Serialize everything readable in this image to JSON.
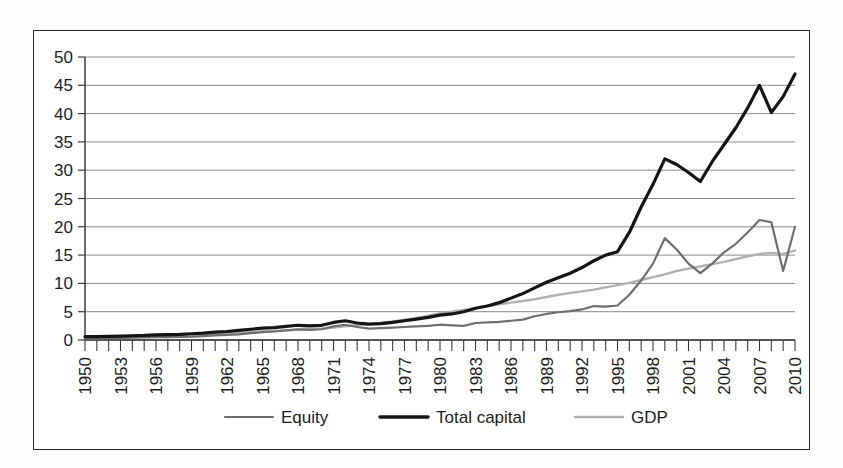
{
  "chart_data": {
    "type": "line",
    "title": "",
    "xlabel": "",
    "ylabel": "",
    "xlim": [
      1950,
      2010
    ],
    "ylim": [
      0,
      50
    ],
    "ytick_step": 5,
    "ytick_labels": [
      "0",
      "5",
      "10",
      "15",
      "20",
      "25",
      "30",
      "35",
      "40",
      "45",
      "50"
    ],
    "xtick_labels": [
      "1950",
      "1953",
      "1956",
      "1959",
      "1962",
      "1965",
      "1968",
      "1971",
      "1974",
      "1977",
      "1980",
      "1983",
      "1986",
      "1989",
      "1992",
      "1995",
      "1998",
      "2001",
      "2004",
      "2007",
      "2010"
    ],
    "xtick_label_rotation": -90,
    "xtick_label_every": 3,
    "grid": "horizontal",
    "legend_position": "bottom",
    "x": [
      1950,
      1951,
      1952,
      1953,
      1954,
      1955,
      1956,
      1957,
      1958,
      1959,
      1960,
      1961,
      1962,
      1963,
      1964,
      1965,
      1966,
      1967,
      1968,
      1969,
      1970,
      1971,
      1972,
      1973,
      1974,
      1975,
      1976,
      1977,
      1978,
      1979,
      1980,
      1981,
      1982,
      1983,
      1984,
      1985,
      1986,
      1987,
      1988,
      1989,
      1990,
      1991,
      1992,
      1993,
      1994,
      1995,
      1996,
      1997,
      1998,
      1999,
      2000,
      2001,
      2002,
      2003,
      2004,
      2005,
      2006,
      2007,
      2008,
      2009,
      2010
    ],
    "series": [
      {
        "name": "Equity",
        "color": "#6e6e6e",
        "width": 2.2,
        "values": [
          0.3,
          0.3,
          0.35,
          0.35,
          0.4,
          0.45,
          0.5,
          0.5,
          0.55,
          0.6,
          0.7,
          0.8,
          0.9,
          1.0,
          1.2,
          1.4,
          1.5,
          1.7,
          1.9,
          1.8,
          1.9,
          2.4,
          2.7,
          2.3,
          2.0,
          2.1,
          2.2,
          2.3,
          2.4,
          2.5,
          2.7,
          2.6,
          2.5,
          3.0,
          3.1,
          3.2,
          3.4,
          3.6,
          4.2,
          4.6,
          4.9,
          5.1,
          5.4,
          6.0,
          5.9,
          6.1,
          8.0,
          10.5,
          13.5,
          18.0,
          16.0,
          13.5,
          11.8,
          13.5,
          15.5,
          17.0,
          19.0,
          21.2,
          20.8,
          12.2,
          20.0
        ]
      },
      {
        "name": "Total capital",
        "color": "#141414",
        "width": 3.2,
        "values": [
          0.6,
          0.6,
          0.65,
          0.7,
          0.75,
          0.8,
          0.9,
          0.95,
          1.0,
          1.1,
          1.2,
          1.4,
          1.5,
          1.7,
          1.9,
          2.1,
          2.2,
          2.4,
          2.6,
          2.5,
          2.6,
          3.1,
          3.4,
          3.0,
          2.8,
          2.9,
          3.1,
          3.4,
          3.7,
          4.0,
          4.4,
          4.6,
          5.0,
          5.6,
          6.0,
          6.6,
          7.4,
          8.2,
          9.2,
          10.2,
          11.0,
          11.8,
          12.8,
          14.0,
          15.0,
          15.6,
          19.0,
          23.5,
          27.5,
          32.0,
          31.0,
          29.6,
          28.0,
          31.5,
          34.5,
          37.5,
          41.0,
          45.0,
          40.2,
          43.0,
          47.0
        ]
      },
      {
        "name": "GDP",
        "color": "#b0b0b0",
        "width": 2.4,
        "values": [
          0.5,
          0.55,
          0.6,
          0.65,
          0.7,
          0.75,
          0.8,
          0.85,
          0.9,
          1.0,
          1.05,
          1.1,
          1.2,
          1.3,
          1.4,
          1.5,
          1.6,
          1.7,
          1.8,
          1.9,
          2.0,
          2.2,
          2.4,
          2.6,
          2.8,
          3.0,
          3.3,
          3.6,
          3.9,
          4.3,
          4.7,
          5.0,
          5.3,
          5.6,
          6.0,
          6.3,
          6.6,
          6.9,
          7.2,
          7.6,
          8.0,
          8.3,
          8.6,
          8.9,
          9.3,
          9.7,
          10.1,
          10.6,
          11.1,
          11.6,
          12.2,
          12.6,
          13.0,
          13.4,
          13.8,
          14.3,
          14.8,
          15.2,
          15.4,
          15.2,
          15.8
        ]
      }
    ]
  },
  "legend": {
    "items": [
      {
        "label": "Equity",
        "color": "#6e6e6e"
      },
      {
        "label": "Total capital",
        "color": "#141414"
      },
      {
        "label": "GDP",
        "color": "#b0b0b0"
      }
    ]
  }
}
